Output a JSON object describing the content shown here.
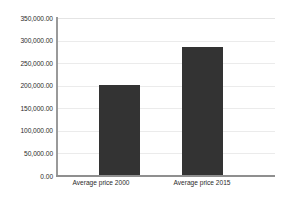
{
  "chart_data": {
    "type": "bar",
    "title": "",
    "xlabel": "",
    "ylabel": "",
    "categories": [
      "Average price 2000",
      "Average price 2015"
    ],
    "values": [
      202000,
      285000
    ],
    "ylim": [
      0,
      350000
    ],
    "ytick_step": 50000,
    "ytick_labels": [
      "0.00",
      "50,000.00",
      "100,000.00",
      "150,000.00",
      "200,000.00",
      "250,000.00",
      "300,000.00",
      "350,000.00"
    ],
    "ytick_values": [
      0,
      50000,
      100000,
      150000,
      200000,
      250000,
      300000,
      350000
    ],
    "grid": true,
    "grid_axis": "y",
    "legend": false,
    "legend_position": "none",
    "series": [
      {
        "name": "Average price",
        "values": [
          202000,
          285000
        ]
      }
    ]
  },
  "style": {
    "bar_color": "#333333",
    "gridline_color": "#ebebeb",
    "axis_color": "#8f8f8f",
    "text_color": "#2b2b2b",
    "background": "#ffffff"
  }
}
